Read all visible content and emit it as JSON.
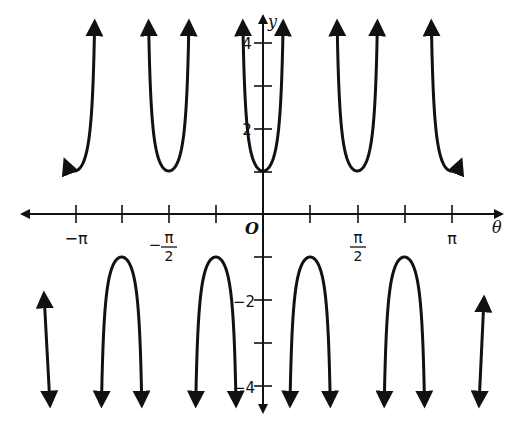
{
  "chart_data": {
    "type": "line",
    "title": "",
    "function": "y = sec(4θ)",
    "xlabel": "θ",
    "ylabel": "y",
    "origin_label": "O",
    "xlim": [
      -3.3,
      3.3
    ],
    "ylim": [
      -4.5,
      4.5
    ],
    "grid": false,
    "legend": null,
    "x_ticks": [
      {
        "value": -3.14159,
        "label": "−π"
      },
      {
        "value": -2.35619,
        "label": ""
      },
      {
        "value": -1.5708,
        "label": "−π/2"
      },
      {
        "value": -0.7854,
        "label": ""
      },
      {
        "value": 0.7854,
        "label": ""
      },
      {
        "value": 1.5708,
        "label": "π/2"
      },
      {
        "value": 2.35619,
        "label": ""
      },
      {
        "value": 3.14159,
        "label": "π"
      }
    ],
    "y_ticks": [
      {
        "value": 4,
        "label": "4"
      },
      {
        "value": 3,
        "label": ""
      },
      {
        "value": 2,
        "label": "2"
      },
      {
        "value": 1,
        "label": ""
      },
      {
        "value": -1,
        "label": ""
      },
      {
        "value": -2,
        "label": "−2"
      },
      {
        "value": -3,
        "label": ""
      },
      {
        "value": -4,
        "label": "−4"
      }
    ],
    "local_minima": [
      {
        "x": -3.14159,
        "y": 1
      },
      {
        "x": -1.5708,
        "y": 1
      },
      {
        "x": 0,
        "y": 1
      },
      {
        "x": 1.5708,
        "y": 1
      },
      {
        "x": 3.14159,
        "y": 1
      }
    ],
    "local_maxima": [
      {
        "x": -2.35619,
        "y": -1
      },
      {
        "x": -0.7854,
        "y": -1
      },
      {
        "x": 0.7854,
        "y": -1
      },
      {
        "x": 2.35619,
        "y": -1
      }
    ],
    "vertical_asymptotes": [
      "θ = π/8 + kπ/4"
    ]
  },
  "axes": {
    "x_label": "θ",
    "y_label": "y",
    "origin": "O",
    "x_tick_labels": {
      "neg_pi": "−π",
      "neg_half_pi_num": "π",
      "neg_half_pi_den": "2",
      "half_pi_num": "π",
      "half_pi_den": "2",
      "pi": "π",
      "minus": "−"
    },
    "y_tick_labels": {
      "four": "4",
      "two": "2",
      "neg_two": "−2",
      "neg_four": "−4"
    }
  }
}
